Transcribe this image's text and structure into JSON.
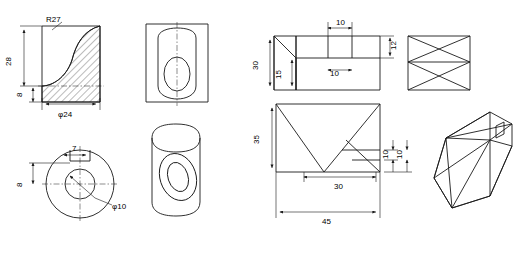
{
  "sheet": {
    "title": "Engineering drawing sheet — orthographic views and isometric solids",
    "background": "#ffffff",
    "line_color": "#1a1a1a",
    "width": 531,
    "height": 256
  },
  "views": [
    {
      "id": "view-1",
      "name": "front-view-hatched-with-fillet",
      "dims": [
        {
          "name": "radius-r27",
          "label": "R27",
          "x": 46,
          "y": 22
        },
        {
          "name": "height-28",
          "label": "28",
          "x": 16,
          "y": 63
        },
        {
          "name": "height-8",
          "label": "8",
          "x": 25,
          "y": 94
        },
        {
          "name": "diameter-24",
          "label": "φ24",
          "x": 72,
          "y": 104
        }
      ]
    },
    {
      "id": "view-2",
      "name": "top-view-oval-pocket",
      "dims": []
    },
    {
      "id": "view-3",
      "name": "circular-view-with-bore",
      "dims": [
        {
          "name": "width-7",
          "label": "7",
          "x": 84,
          "y": 147
        },
        {
          "name": "height-8",
          "label": "8",
          "x": 25,
          "y": 184
        },
        {
          "name": "diameter-10",
          "label": "φ10",
          "x": 112,
          "y": 205
        }
      ]
    },
    {
      "id": "view-4",
      "name": "pictorial-cylinder-with-oval-hole",
      "dims": []
    },
    {
      "id": "view-5",
      "name": "top-view-stepped-block",
      "dims": [
        {
          "name": "width-10-upper",
          "label": "10",
          "x": 342,
          "y": 25
        },
        {
          "name": "height-12",
          "label": "12",
          "x": 400,
          "y": 55
        },
        {
          "name": "height-30",
          "label": "30",
          "x": 262,
          "y": 67
        },
        {
          "name": "height-15",
          "label": "15",
          "x": 286,
          "y": 78
        },
        {
          "name": "width-10-lower",
          "label": "10",
          "x": 335,
          "y": 72
        }
      ]
    },
    {
      "id": "view-6",
      "name": "side-view-triangulated",
      "dims": []
    },
    {
      "id": "view-7",
      "name": "front-view-wedge-block",
      "dims": [
        {
          "name": "height-35",
          "label": "35",
          "x": 264,
          "y": 141
        },
        {
          "name": "height-10-a",
          "label": "10",
          "x": 390,
          "y": 148
        },
        {
          "name": "height-10-b",
          "label": "10",
          "x": 404,
          "y": 148
        },
        {
          "name": "width-30",
          "label": "30",
          "x": 340,
          "y": 181
        },
        {
          "name": "width-45",
          "label": "45",
          "x": 334,
          "y": 217
        }
      ]
    },
    {
      "id": "view-8",
      "name": "isometric-wedge-solid",
      "dims": []
    }
  ]
}
